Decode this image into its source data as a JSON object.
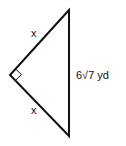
{
  "diagram": {
    "type": "right isosceles triangle",
    "labels": {
      "upper_leg": "x",
      "lower_leg": "x",
      "hypotenuse": "6√7 yd"
    },
    "right_angle_marker": true,
    "stroke_color": "#111111"
  }
}
